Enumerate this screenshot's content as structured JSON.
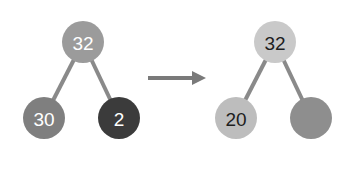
{
  "diagram": {
    "type": "heap-tree-transformation",
    "before": {
      "nodes": [
        {
          "id": "root",
          "label": "32",
          "cx": 83,
          "cy": 42,
          "r": 21,
          "fill": "#9b9b9b",
          "text_color": "#ffffff"
        },
        {
          "id": "left",
          "label": "30",
          "cx": 44,
          "cy": 118,
          "r": 21,
          "fill": "#7f7f7f",
          "text_color": "#ffffff"
        },
        {
          "id": "right",
          "label": "2",
          "cx": 119,
          "cy": 118,
          "r": 21,
          "fill": "#3b3b3b",
          "text_color": "#ffffff"
        }
      ],
      "edges": [
        [
          "root",
          "left"
        ],
        [
          "root",
          "right"
        ]
      ],
      "edge_color": "#8a8a8a"
    },
    "arrow": {
      "x1": 148,
      "y1": 78,
      "x2": 206,
      "y2": 78,
      "color": "#7a7a7a",
      "direction": "right"
    },
    "after": {
      "nodes": [
        {
          "id": "root",
          "label": "32",
          "cx": 275,
          "cy": 42,
          "r": 21,
          "fill": "#c9c9c9",
          "text_color": "#1e1e1e"
        },
        {
          "id": "left",
          "label": "20",
          "cx": 236,
          "cy": 118,
          "r": 21,
          "fill": "#bdbdbd",
          "text_color": "#1e1e1e"
        },
        {
          "id": "right",
          "label": "",
          "cx": 311,
          "cy": 118,
          "r": 21,
          "fill": "#8e8e8e",
          "text_color": "#1e1e1e"
        }
      ],
      "edges": [
        [
          "root",
          "left"
        ],
        [
          "root",
          "right"
        ]
      ],
      "edge_color": "#8a8a8a"
    }
  }
}
